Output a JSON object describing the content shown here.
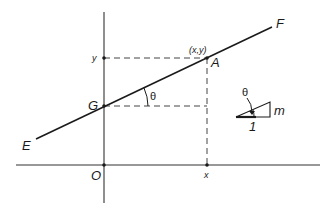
{
  "diagram": {
    "type": "coordinate-geometry",
    "colors": {
      "line": "#1a1a1a",
      "axis": "#333333",
      "dashed": "#444444",
      "background": "#ffffff"
    },
    "labels": {
      "line_start": "E",
      "line_end": "F",
      "intercept_point": "G",
      "point_on_line": "A",
      "point_coords": "(x,y)",
      "origin": "O",
      "x_tick": "x",
      "y_tick": "y",
      "angle": "θ",
      "triangle_angle": "θ",
      "triangle_run": "1",
      "triangle_rise": "m"
    }
  }
}
